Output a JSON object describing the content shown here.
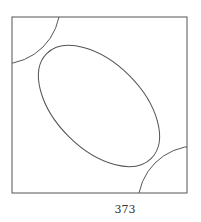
{
  "figure": {
    "stroke_color": "#555555",
    "frame": {
      "x": 12,
      "y": 17,
      "width": 175,
      "height": 176
    },
    "ellipse": {
      "cx": 99,
      "cy": 106,
      "rx": 74,
      "ry": 43,
      "rotation_deg": 45
    },
    "arc_top_left": {
      "cx": 2,
      "cy": 6,
      "r": 58
    },
    "arc_bottom_right": {
      "cx": 196,
      "cy": 204,
      "r": 58
    }
  },
  "page": {
    "number": "373"
  }
}
